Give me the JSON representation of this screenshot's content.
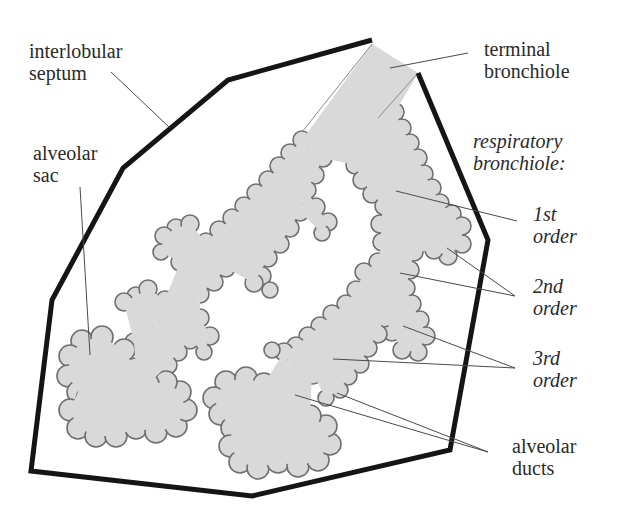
{
  "diagram": {
    "colors": {
      "septum_stroke": "#151515",
      "airway_fill": "#d9d9d9",
      "airway_outline": "#6f6f6f",
      "leader_line": "#4a4a4a",
      "text": "#2a2a2a",
      "background": "#ffffff"
    },
    "labels": {
      "interlobular_septum": {
        "line1": "interlobular",
        "line2": "septum"
      },
      "alveolar_sac": {
        "line1": "alveolar",
        "line2": "sac"
      },
      "terminal_bronchiole": {
        "line1": "terminal",
        "line2": "bronchiole"
      },
      "respiratory_bronchiole": {
        "line1": "respiratory",
        "line2": "bronchiole:"
      },
      "first_order": {
        "line1": "1st",
        "line2": "order"
      },
      "second_order": {
        "line1": "2nd",
        "line2": "order"
      },
      "third_order": {
        "line1": "3rd",
        "line2": "order"
      },
      "alveolar_ducts": {
        "line1": "alveolar",
        "line2": "ducts"
      }
    }
  }
}
